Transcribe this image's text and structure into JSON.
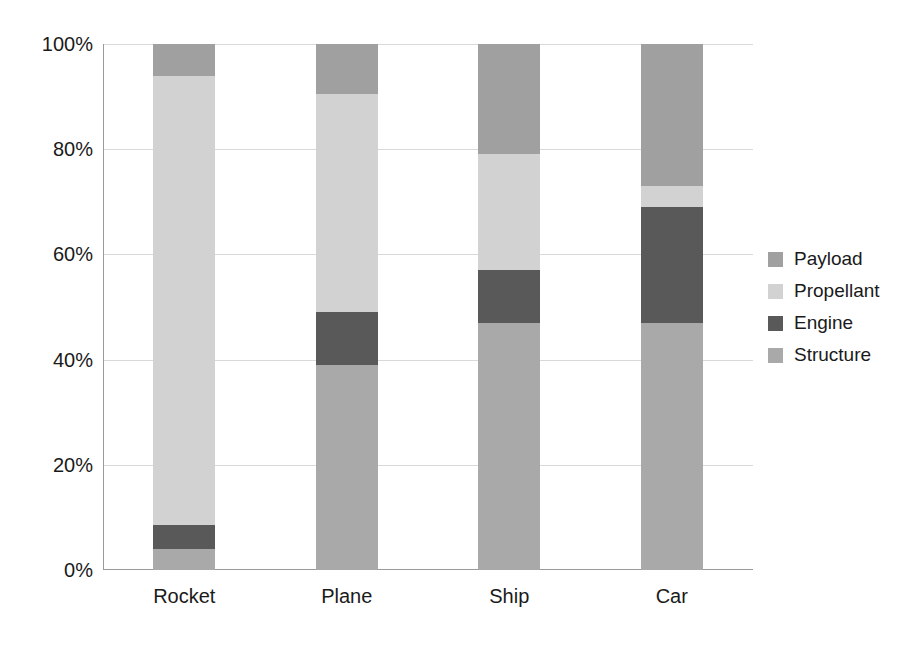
{
  "chart_data": {
    "type": "bar",
    "subtype": "stacked-100-percent",
    "title": "",
    "xlabel": "",
    "ylabel": "",
    "categories": [
      "Rocket",
      "Plane",
      "Ship",
      "Car"
    ],
    "series": [
      {
        "name": "Structure",
        "color": "#a9a9a9",
        "values": [
          4,
          39,
          47,
          47
        ]
      },
      {
        "name": "Engine",
        "color": "#595959",
        "values": [
          4.5,
          10,
          10,
          22
        ]
      },
      {
        "name": "Propellant",
        "color": "#d2d2d2",
        "values": [
          85.5,
          41.5,
          22,
          4
        ]
      },
      {
        "name": "Payload",
        "color": "#a0a0a0",
        "values": [
          6,
          9.5,
          21,
          27
        ]
      }
    ],
    "legend_order": [
      "Payload",
      "Propellant",
      "Engine",
      "Structure"
    ],
    "legend_position": "right",
    "ylim": [
      0,
      100
    ],
    "yticks": [
      0,
      20,
      40,
      60,
      80,
      100
    ],
    "ytick_labels": [
      "0%",
      "20%",
      "40%",
      "60%",
      "80%",
      "100%"
    ],
    "grid": true,
    "grid_axis": "y",
    "units": "percent"
  },
  "axes": {
    "y": {
      "ticks": [
        {
          "value": 100,
          "label": "100%"
        },
        {
          "value": 80,
          "label": "80%"
        },
        {
          "value": 60,
          "label": "60%"
        },
        {
          "value": 40,
          "label": "40%"
        },
        {
          "value": 20,
          "label": "20%"
        },
        {
          "value": 0,
          "label": "0%"
        }
      ]
    },
    "x": {
      "ticks": [
        {
          "label": "Rocket"
        },
        {
          "label": "Plane"
        },
        {
          "label": "Ship"
        },
        {
          "label": "Car"
        }
      ]
    }
  },
  "legend": {
    "items": [
      {
        "label": "Payload",
        "color": "#a0a0a0"
      },
      {
        "label": "Propellant",
        "color": "#d2d2d2"
      },
      {
        "label": "Engine",
        "color": "#595959"
      },
      {
        "label": "Structure",
        "color": "#a9a9a9"
      }
    ]
  },
  "colors": {
    "payload": "#a0a0a0",
    "propellant": "#d2d2d2",
    "engine": "#595959",
    "structure": "#a9a9a9",
    "axis": "#9a9a9a",
    "grid": "#d9d9d9",
    "text": "#1a1a1a",
    "background": "#ffffff"
  }
}
